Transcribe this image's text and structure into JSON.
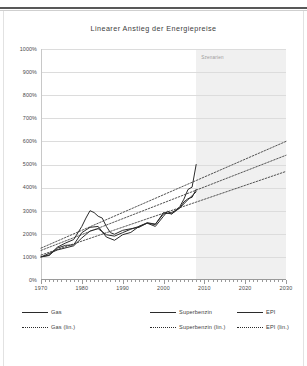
{
  "chart_data": {
    "type": "line",
    "title": "Linearer Anstieg der Energiepreise",
    "xlabel": "",
    "ylabel": "",
    "xlim": [
      1970,
      2030
    ],
    "ylim": [
      0,
      1000
    ],
    "grid": true,
    "legend_position": "bottom",
    "x_ticks": [
      1970,
      1980,
      1990,
      2000,
      2010,
      2020,
      2030
    ],
    "x_tick_labels": [
      "1970",
      "1980",
      "1990",
      "2000",
      "2010",
      "2020",
      "2030"
    ],
    "y_ticks": [
      0,
      100,
      200,
      300,
      400,
      500,
      600,
      700,
      800,
      900,
      1000
    ],
    "y_tick_labels": [
      "0%",
      "100%",
      "200%",
      "300%",
      "400%",
      "500%",
      "600%",
      "700%",
      "800%",
      "900%",
      "1000%"
    ],
    "annotations": [
      {
        "text": "Szenarien",
        "x": 2009,
        "y": 980
      }
    ],
    "shaded_region": {
      "label": "Szenarien",
      "x_start": 2008,
      "x_end": 2030,
      "color": "#ededed"
    },
    "series": [
      {
        "name": "Gas",
        "style": "solid",
        "color": "#2b2b2b",
        "x": [
          1970,
          1972,
          1974,
          1976,
          1978,
          1980,
          1981,
          1982,
          1983,
          1984,
          1985,
          1986,
          1987,
          1988,
          1990,
          1992,
          1994,
          1996,
          1998,
          2000,
          2001,
          2002,
          2003,
          2004,
          2005,
          2006,
          2007,
          2008
        ],
        "values": [
          100,
          108,
          142,
          160,
          175,
          232,
          268,
          300,
          292,
          276,
          268,
          232,
          205,
          198,
          215,
          222,
          228,
          246,
          232,
          276,
          298,
          286,
          300,
          318,
          350,
          392,
          402,
          500
        ]
      },
      {
        "name": "Superbenzin",
        "style": "solid",
        "color": "#2b2b2b",
        "x": [
          1970,
          1972,
          1974,
          1976,
          1978,
          1980,
          1982,
          1984,
          1986,
          1988,
          1990,
          1992,
          1994,
          1996,
          1998,
          2000,
          2002,
          2004,
          2005,
          2006,
          2007,
          2008
        ],
        "values": [
          100,
          106,
          138,
          150,
          152,
          205,
          228,
          232,
          186,
          172,
          196,
          206,
          232,
          246,
          240,
          292,
          286,
          312,
          338,
          352,
          358,
          392
        ]
      },
      {
        "name": "EPI",
        "style": "solid",
        "color": "#2b2b2b",
        "x": [
          1970,
          1974,
          1978,
          1980,
          1982,
          1984,
          1986,
          1988,
          1990,
          1992,
          1994,
          1996,
          1998,
          2000,
          2002,
          2004,
          2006,
          2008
        ],
        "values": [
          100,
          130,
          148,
          182,
          212,
          222,
          196,
          190,
          205,
          220,
          232,
          248,
          242,
          286,
          292,
          312,
          348,
          382
        ]
      },
      {
        "name": "Gas (lin.)",
        "style": "dotted",
        "color": "#2b2b2b",
        "x": [
          1970,
          2030
        ],
        "values": [
          138,
          600
        ]
      },
      {
        "name": "Superbenzin (lin.)",
        "style": "dotted",
        "color": "#2b2b2b",
        "x": [
          1970,
          2030
        ],
        "values": [
          128,
          540
        ]
      },
      {
        "name": "EPI (lin.)",
        "style": "dotted",
        "color": "#2b2b2b",
        "x": [
          1970,
          2030
        ],
        "values": [
          108,
          470
        ]
      }
    ]
  },
  "legend": {
    "rows": [
      [
        {
          "label": "Gas",
          "style": "solid"
        },
        {
          "label": "Superbenzin",
          "style": "solid"
        },
        {
          "label": "EPI",
          "style": "solid"
        }
      ],
      [
        {
          "label": "Gas (lin.)",
          "style": "dotted"
        },
        {
          "label": "Superbenzin (lin.)",
          "style": "dotted"
        },
        {
          "label": "EPI (lin.)",
          "style": "dotted"
        }
      ]
    ]
  },
  "colors": {
    "series": "#2b2b2b",
    "grid": "#dcdcdc",
    "band": "#ededed",
    "text": "#3c3c3c"
  }
}
